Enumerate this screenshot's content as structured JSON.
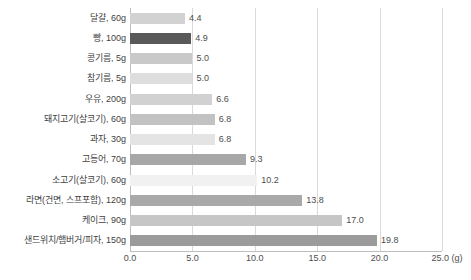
{
  "chart_data": {
    "type": "bar",
    "orientation": "horizontal",
    "title": "",
    "xlabel": "(g)",
    "ylabel": "",
    "xlim": [
      0.0,
      25.0
    ],
    "grid": true,
    "legend": "none",
    "unit_note": "(g)",
    "xticks": [
      "0.0",
      "5.0",
      "10.0",
      "15.0",
      "20.0",
      "25.0"
    ],
    "xtick_values": [
      0.0,
      5.0,
      10.0,
      15.0,
      20.0,
      25.0
    ],
    "categories": [
      "달걀, 60g",
      "빵, 100g",
      "콩기름, 5g",
      "참기름, 5g",
      "우유, 200g",
      "돼지고기(살코기), 60g",
      "과자, 30g",
      "고등어, 70g",
      "소고기(살코기), 60g",
      "라면(건면, 스프포함), 120g",
      "케이크, 90g",
      "샌드위치/햄버거/피자, 150g"
    ],
    "values": [
      4.4,
      4.9,
      5.0,
      5.0,
      6.6,
      6.8,
      6.8,
      9.3,
      10.2,
      13.8,
      17.0,
      19.8
    ],
    "value_labels": [
      "4.4",
      "4.9",
      "5.0",
      "5.0",
      "6.6",
      "6.8",
      "6.8",
      "9.3",
      "10.2",
      "13.8",
      "17.0",
      "19.8"
    ],
    "bar_colors": [
      "#d2d2d2",
      "#595959",
      "#c9c9c9",
      "#dedede",
      "#d1d1d1",
      "#c2c2c2",
      "#e4e4e4",
      "#a7a7a7",
      "#f1f1f1",
      "#a9a9a9",
      "#c6c6c6",
      "#9b9b9b"
    ]
  },
  "colors": {
    "gridline": "#d9d9d9",
    "axis": "#bdbdbd",
    "label_text": "#3f3f3f",
    "value_text": "#4d4d4d",
    "background": "#ffffff"
  }
}
